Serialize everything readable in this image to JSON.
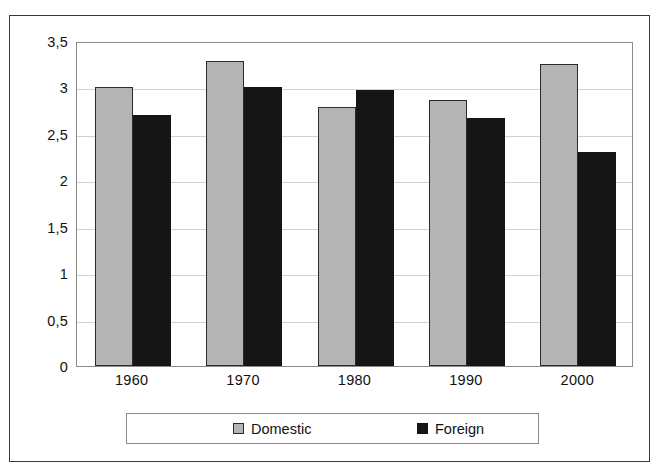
{
  "chart_data": {
    "type": "bar",
    "title": "",
    "subtitle": "",
    "xlabel": "",
    "ylabel": "",
    "categories": [
      "1960",
      "1970",
      "1980",
      "1990",
      "2000"
    ],
    "series": [
      {
        "name": "Domestic",
        "color": "#b4b4b4",
        "values": [
          3.0,
          3.28,
          2.79,
          2.87,
          3.25
        ]
      },
      {
        "name": "Foreign",
        "color": "#151515",
        "values": [
          2.7,
          3.0,
          2.97,
          2.67,
          2.3
        ]
      }
    ],
    "ylim": [
      0,
      3.5
    ],
    "ytick_labels": [
      "0",
      "0,5",
      "1",
      "1,5",
      "2",
      "2,5",
      "3",
      "3,5"
    ],
    "ytick_values": [
      0,
      0.5,
      1,
      1.5,
      2,
      2.5,
      3,
      3.5
    ],
    "grid": true,
    "grid_axis": "y",
    "legend_position": "bottom",
    "decimal_separator": ","
  },
  "legend": {
    "entries": [
      {
        "label": "Domestic",
        "swatch": "gray-square-icon"
      },
      {
        "label": "Foreign",
        "swatch": "black-square-icon"
      }
    ]
  },
  "colors": {
    "domestic": "#b4b4b4",
    "foreign": "#151515",
    "grid": "#d2d2d2",
    "frame": "#8a8a8a",
    "outer_border": "#3a3a3a",
    "text": "#111111"
  }
}
